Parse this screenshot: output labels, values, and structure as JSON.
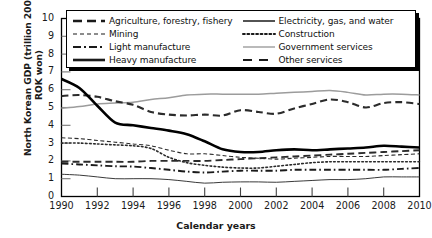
{
  "chart_data": {
    "type": "line",
    "title": "",
    "xlabel": "Calendar years",
    "ylabel": "North Korean GDP (trillion 2005 ROK won)",
    "ylabel_line1": "North Korean GDP (trillion 2005",
    "ylabel_line2": "ROK won)",
    "xlim": [
      1990,
      2010
    ],
    "ylim": [
      0,
      10
    ],
    "grid": false,
    "legend_position": "top-inside",
    "x": [
      1990,
      1991,
      1992,
      1993,
      1994,
      1995,
      1996,
      1997,
      1998,
      1999,
      2000,
      2001,
      2002,
      2003,
      2004,
      2005,
      2006,
      2007,
      2008,
      2009,
      2010
    ],
    "yticks": [
      0,
      1,
      2,
      3,
      4,
      5,
      6,
      7,
      8,
      9,
      10
    ],
    "xticks": [
      1990,
      1992,
      1994,
      1996,
      1998,
      2000,
      2002,
      2004,
      2006,
      2008,
      2010
    ],
    "series": [
      {
        "name": "Agriculture, forestry, fishery",
        "style": "dashed",
        "color": "#2b2b2b",
        "width": 2.1,
        "values": [
          5.65,
          5.7,
          5.6,
          5.35,
          5.15,
          4.75,
          4.6,
          4.55,
          4.6,
          4.55,
          4.85,
          4.75,
          4.65,
          4.95,
          5.2,
          5.45,
          5.3,
          5.0,
          5.25,
          5.3,
          5.2
        ]
      },
      {
        "name": "Mining",
        "style": "fine-dashed",
        "color": "#2b2b2b",
        "width": 1.1,
        "values": [
          3.3,
          3.25,
          3.15,
          3.05,
          2.95,
          2.85,
          2.6,
          2.4,
          2.4,
          2.3,
          2.2,
          2.15,
          2.1,
          2.15,
          2.2,
          2.25,
          2.25,
          2.25,
          2.3,
          2.35,
          2.4
        ]
      },
      {
        "name": "Light manufacture",
        "style": "dash-dot",
        "color": "#1a1a1a",
        "width": 1.9,
        "values": [
          1.85,
          1.8,
          1.75,
          1.7,
          1.68,
          1.6,
          1.5,
          1.4,
          1.35,
          1.4,
          1.45,
          1.45,
          1.45,
          1.5,
          1.5,
          1.5,
          1.5,
          1.5,
          1.5,
          1.55,
          1.6
        ]
      },
      {
        "name": "Heavy manufacture",
        "style": "solid",
        "color": "#000000",
        "width": 2.6,
        "values": [
          6.6,
          6.1,
          5.1,
          4.15,
          4.0,
          3.85,
          3.7,
          3.5,
          3.1,
          2.65,
          2.5,
          2.5,
          2.6,
          2.65,
          2.6,
          2.65,
          2.7,
          2.75,
          2.85,
          2.8,
          2.75
        ]
      },
      {
        "name": "Electricity, gas, and water",
        "style": "solid",
        "color": "#3a3a3a",
        "width": 1.0,
        "values": [
          1.25,
          1.2,
          1.1,
          1.0,
          1.0,
          1.0,
          0.95,
          0.85,
          0.75,
          0.8,
          0.82,
          0.82,
          0.8,
          0.85,
          0.9,
          0.95,
          0.95,
          1.0,
          1.1,
          1.1,
          1.1
        ]
      },
      {
        "name": "Construction",
        "style": "dotted",
        "color": "#2b2b2b",
        "width": 1.6,
        "values": [
          3.0,
          3.0,
          2.95,
          2.9,
          2.85,
          2.7,
          2.2,
          1.9,
          1.75,
          1.65,
          1.6,
          1.6,
          1.7,
          1.8,
          1.9,
          1.95,
          1.95,
          1.95,
          1.95,
          1.95,
          1.95
        ]
      },
      {
        "name": "Government services",
        "style": "solid",
        "color": "#9c9c9c",
        "width": 1.5,
        "values": [
          4.95,
          5.05,
          5.2,
          5.25,
          5.3,
          5.45,
          5.55,
          5.7,
          5.75,
          5.75,
          5.75,
          5.75,
          5.8,
          5.85,
          5.9,
          5.95,
          5.85,
          5.7,
          5.75,
          5.75,
          5.7
        ]
      },
      {
        "name": "Other services",
        "style": "dashed",
        "color": "#2b2b2b",
        "width": 1.9,
        "values": [
          1.95,
          1.95,
          1.95,
          1.95,
          1.95,
          2.0,
          2.0,
          2.0,
          2.0,
          2.05,
          2.1,
          2.15,
          2.2,
          2.25,
          2.3,
          2.35,
          2.4,
          2.45,
          2.5,
          2.55,
          2.6
        ]
      }
    ]
  },
  "legend": {
    "column_left": [
      {
        "label": "Agriculture, forestry, fishery",
        "key": "dashed-bold-key"
      },
      {
        "label": "Mining",
        "key": "fine-dashed-key"
      },
      {
        "label": "Light manufacture",
        "key": "dash-dot-key"
      },
      {
        "label": "Heavy manufacture",
        "key": "solid-bold-key"
      }
    ],
    "column_right": [
      {
        "label": "Electricity, gas, and water",
        "key": "solid-thin-key"
      },
      {
        "label": "Construction",
        "key": "dotted-key"
      },
      {
        "label": "Government services",
        "key": "solid-gray-key"
      },
      {
        "label": "Other services",
        "key": "dashed-wide-key"
      }
    ]
  },
  "colors": {
    "axis": "#000000",
    "text": "#1a1a1a",
    "government": "#9c9c9c",
    "background": "#ffffff"
  }
}
